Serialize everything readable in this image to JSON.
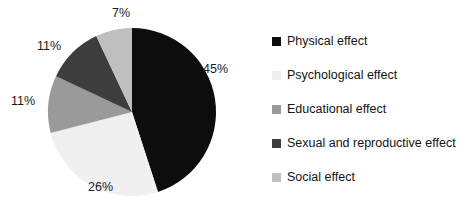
{
  "chart_data": {
    "type": "pie",
    "title": "",
    "categories": [
      "Physical effect",
      "Psychological effect",
      "Educational effect",
      "Sexual and reproductive effect",
      "Social effect"
    ],
    "values": [
      45,
      26,
      11,
      11,
      7
    ],
    "value_labels": [
      "45%",
      "26%",
      "11%",
      "11%",
      "7%"
    ],
    "colors": [
      "#0d0d0d",
      "#f0f0f0",
      "#9a9a9a",
      "#3d3d3d",
      "#bfbfbf"
    ],
    "legend_position": "right",
    "start_angle_clock": "12 o'clock",
    "direction": "clockwise",
    "grid": false,
    "units": "percent"
  },
  "slices": [
    {
      "label": "Physical effect",
      "pct": "45%",
      "color": "#0d0d0d"
    },
    {
      "label": "Psychological effect",
      "pct": "26%",
      "color": "#f0f0f0"
    },
    {
      "label": "Educational effect",
      "pct": "11%",
      "color": "#9a9a9a"
    },
    {
      "label": "Sexual and reproductive effect",
      "pct": "11%",
      "color": "#3d3d3d"
    },
    {
      "label": "Social effect",
      "pct": "7%",
      "color": "#bfbfbf"
    }
  ],
  "legend": {
    "items": [
      {
        "label": "Physical effect",
        "color": "#0d0d0d"
      },
      {
        "label": "Psychological effect",
        "color": "#f0f0f0"
      },
      {
        "label": "Educational effect",
        "color": "#9a9a9a"
      },
      {
        "label": "Sexual and reproductive effect",
        "color": "#3d3d3d"
      },
      {
        "label": "Social effect",
        "color": "#bfbfbf"
      }
    ]
  }
}
